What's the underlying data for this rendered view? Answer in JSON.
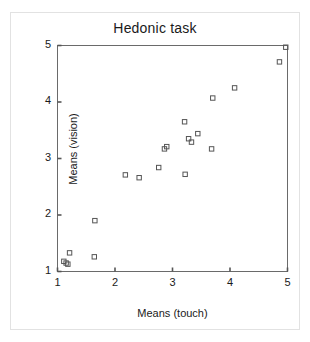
{
  "chart_data": {
    "type": "scatter",
    "title": "Hedonic task",
    "xlabel": "Means (touch)",
    "ylabel": "Means (vision)",
    "xlim": [
      1,
      5
    ],
    "ylim": [
      1,
      5
    ],
    "xticks": [
      1,
      2,
      3,
      4,
      5
    ],
    "yticks": [
      1,
      2,
      3,
      4,
      5
    ],
    "xticklabels": [
      "1",
      "2",
      "3",
      "4",
      "5"
    ],
    "yticklabels": [
      "1",
      "2",
      "3",
      "4",
      "5"
    ],
    "grid": false,
    "legend": null,
    "marker": "open-square",
    "marker_color": "#555555",
    "points": [
      {
        "x": 1.11,
        "y": 1.18
      },
      {
        "x": 1.15,
        "y": 1.15
      },
      {
        "x": 1.18,
        "y": 1.13
      },
      {
        "x": 1.21,
        "y": 1.33
      },
      {
        "x": 1.64,
        "y": 1.26
      },
      {
        "x": 1.65,
        "y": 1.9
      },
      {
        "x": 2.18,
        "y": 2.71
      },
      {
        "x": 2.42,
        "y": 2.66
      },
      {
        "x": 2.76,
        "y": 2.84
      },
      {
        "x": 2.86,
        "y": 3.17
      },
      {
        "x": 2.9,
        "y": 3.21
      },
      {
        "x": 3.21,
        "y": 3.65
      },
      {
        "x": 3.22,
        "y": 2.72
      },
      {
        "x": 3.28,
        "y": 3.35
      },
      {
        "x": 3.33,
        "y": 3.29
      },
      {
        "x": 3.44,
        "y": 3.44
      },
      {
        "x": 3.68,
        "y": 3.17
      },
      {
        "x": 3.7,
        "y": 4.07
      },
      {
        "x": 4.08,
        "y": 4.25
      },
      {
        "x": 4.86,
        "y": 4.71
      },
      {
        "x": 4.97,
        "y": 4.97
      }
    ]
  },
  "axes": {
    "title": "Hedonic task",
    "x_label": "Means (touch)",
    "y_label": "Means (vision)",
    "x_ticks": [
      "1",
      "2",
      "3",
      "4",
      "5"
    ],
    "y_ticks": [
      "1",
      "2",
      "3",
      "4",
      "5"
    ]
  },
  "colors": {
    "axis": "#555555",
    "marker": "#555555",
    "text": "#1a1a1a",
    "outer_border": "#e2e2e2",
    "background": "#ffffff"
  }
}
